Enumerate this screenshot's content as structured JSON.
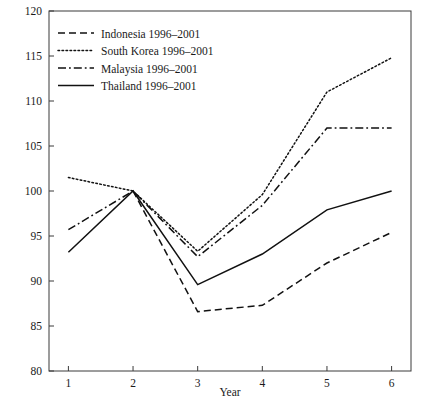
{
  "chart_data": {
    "type": "line",
    "title": "",
    "xlabel": "Year",
    "ylabel": "",
    "x": [
      1,
      2,
      3,
      4,
      5,
      6
    ],
    "xtick_labels": [
      "1",
      "2",
      "3",
      "4",
      "5",
      "6"
    ],
    "ytick_labels": [
      "80",
      "85",
      "90",
      "95",
      "100",
      "105",
      "110",
      "115",
      "120"
    ],
    "yticks": [
      80,
      85,
      90,
      95,
      100,
      105,
      110,
      115,
      120
    ],
    "xlim": [
      0.7,
      6.3
    ],
    "ylim": [
      80,
      120
    ],
    "grid": false,
    "legend_position": "top-left",
    "series": [
      {
        "name": "Indonesia 1996–2001",
        "style": "dashed",
        "values": [
          null,
          100.0,
          86.6,
          87.3,
          92.0,
          95.4
        ]
      },
      {
        "name": "South Korea 1996–2001",
        "style": "dotted",
        "values": [
          101.5,
          100.0,
          93.3,
          99.6,
          111.0,
          114.8
        ]
      },
      {
        "name": "Malaysia 1996–2001",
        "style": "dashdot",
        "values": [
          95.7,
          100.0,
          92.7,
          98.4,
          107.0,
          107.0
        ]
      },
      {
        "name": "Thailand 1996–2001",
        "style": "solid",
        "values": [
          93.2,
          100.0,
          89.6,
          93.0,
          97.9,
          100.0
        ]
      }
    ]
  },
  "legend": {
    "entries": [
      {
        "label": "Indonesia 1996–2001",
        "style": "dashed"
      },
      {
        "label": "South Korea 1996–2001",
        "style": "dotted"
      },
      {
        "label": "Malaysia 1996–2001",
        "style": "dashdot"
      },
      {
        "label": "Thailand 1996–2001",
        "style": "solid"
      }
    ]
  },
  "axes": {
    "x_title": "Year"
  }
}
